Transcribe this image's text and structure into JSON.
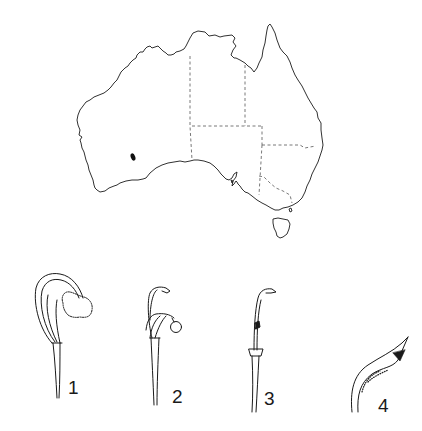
{
  "figure": {
    "colors": {
      "background": "#ffffff",
      "ink": "#1a1a1a",
      "border_dash": "#555555",
      "distribution_marker": "#111111"
    },
    "map": {
      "subject": "Australia",
      "state_borders": "dashed",
      "distribution_markers": [
        {
          "region": "south-west Western Australia",
          "shape": "filled-ellipse"
        }
      ]
    },
    "illustrations": [
      {
        "label": "1"
      },
      {
        "label": "2"
      },
      {
        "label": "3"
      },
      {
        "label": "4"
      }
    ]
  }
}
